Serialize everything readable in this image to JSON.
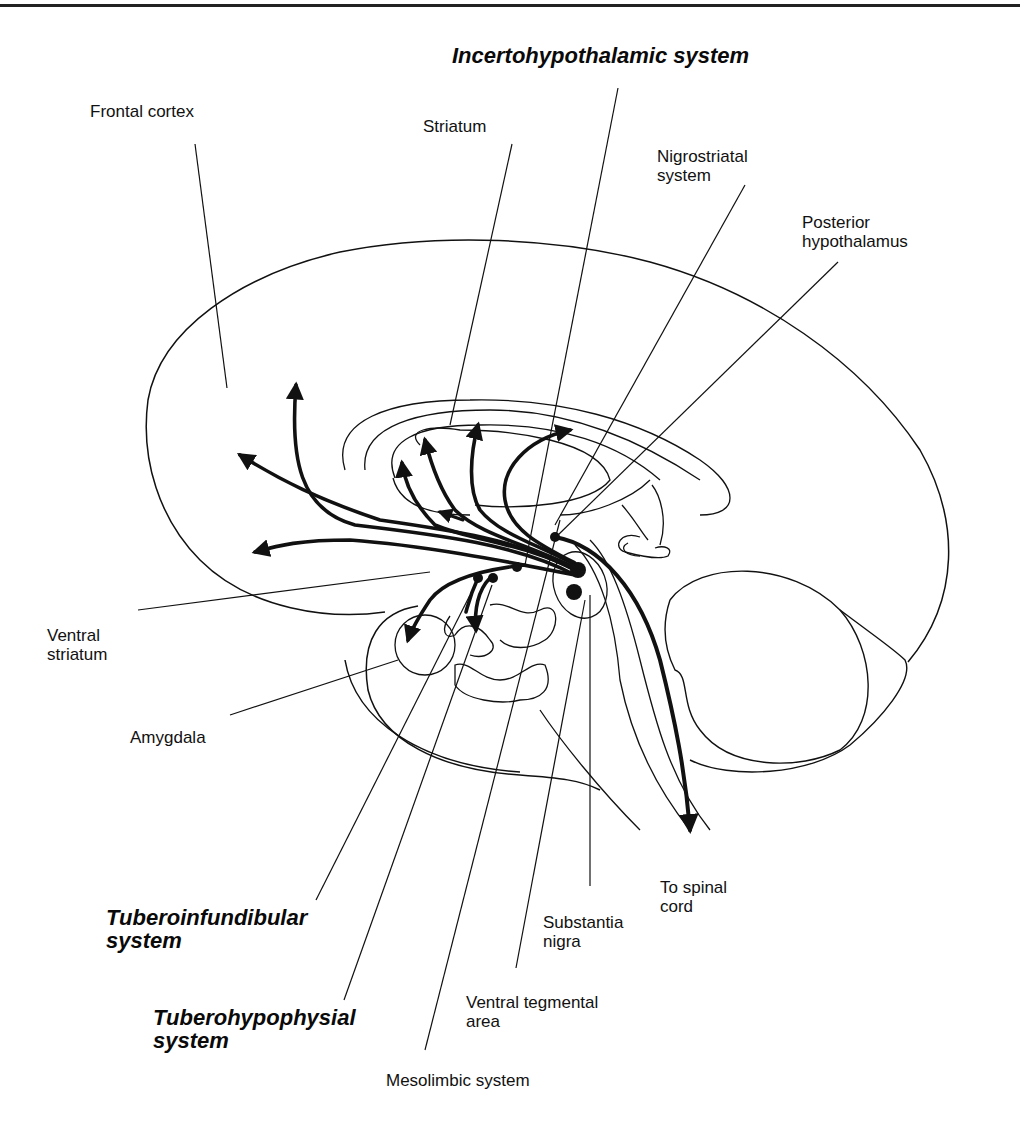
{
  "labels": {
    "incertohypothalamic": "Incertohypothalamic system",
    "frontal_cortex": "Frontal cortex",
    "striatum": "Striatum",
    "nigrostriatal": "Nigrostriatal\nsystem",
    "posterior_hypothalamus": "Posterior\nhypothalamus",
    "ventral_striatum": "Ventral\nstriatum",
    "amygdala": "Amygdala",
    "tuberoinfundibular": "Tuberoinfundibular\nsystem",
    "tuberohypophysial": "Tuberohypophysial\nsystem",
    "mesolimbic": "Mesolimbic system",
    "ventral_tegmental": "Ventral tegmental\narea",
    "substantia_nigra": "Substantia\nnigra",
    "to_spinal_cord": "To spinal\ncord"
  },
  "label_styles": {
    "emphasized_systems": [
      "Incertohypothalamic system",
      "Tuberoinfundibular system",
      "Tuberohypophysial system"
    ]
  },
  "colors": {
    "line": "#111111",
    "background": "#ffffff"
  }
}
